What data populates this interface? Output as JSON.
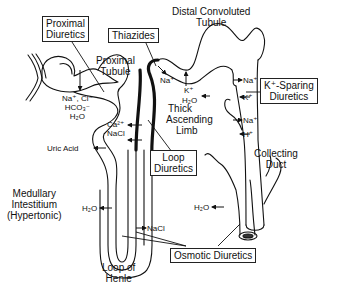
{
  "diagram": {
    "drug_boxes": {
      "proximal": [
        "Proximal",
        "Diuretics"
      ],
      "thiazides": "Thiazides",
      "k_sparing": [
        "K⁺-Sparing",
        "Diuretics"
      ],
      "loop": [
        "Loop",
        "Diuretics"
      ],
      "osmotic": "Osmotic Diuretics"
    },
    "structures": {
      "proximal_tubule": [
        "Proximal",
        "Tubule"
      ],
      "distal_tubule": [
        "Distal Convoluted",
        "Tubule"
      ],
      "thick_ascending_limb": [
        "Thick",
        "Ascending",
        "Limb"
      ],
      "collecting_duct": [
        "Collecting",
        "Duct"
      ],
      "loop_of_henle": [
        "Loop of",
        "Henle"
      ],
      "medullary": [
        "Medullary",
        "Intestitium",
        "(Hypertonic)"
      ]
    },
    "ions": {
      "proximal": [
        "Na⁺, Cl⁻",
        "HCO₃⁻",
        "H₂O"
      ],
      "uric_acid": "Uric Acid",
      "tal": [
        "Ca²⁺",
        "NaCl"
      ],
      "distal_na": "Na⁺",
      "distal_k": "K⁺",
      "distal_h2o": "H₂O",
      "cd": [
        "Na⁺",
        "K⁺",
        "Na⁺",
        "H⁺"
      ],
      "descending_h2o": "H₂O",
      "ascending_nacl": "NaCl",
      "cd_h2o": "H₂O"
    }
  }
}
